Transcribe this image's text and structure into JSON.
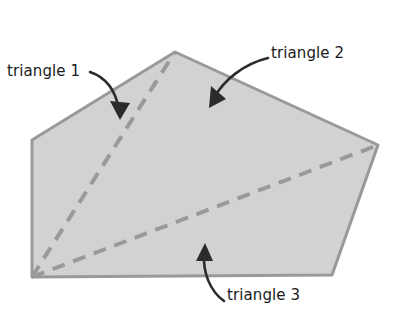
{
  "figure": {
    "name": "polygon-triangulation-diagram",
    "background_color": "#ffffff",
    "width": 414,
    "height": 324,
    "polygon": {
      "name": "pentagon",
      "fill_color": "#d2d2d2",
      "stroke_color": "#999999",
      "stroke_width": 3,
      "vertices": [
        {
          "label": "left",
          "x": 32,
          "y": 140
        },
        {
          "label": "apex",
          "x": 175,
          "y": 52
        },
        {
          "label": "right",
          "x": 378,
          "y": 145
        },
        {
          "label": "bottom-right",
          "x": 332,
          "y": 275
        },
        {
          "label": "bottom-left",
          "x": 32,
          "y": 277
        }
      ]
    },
    "diagonals": [
      {
        "name": "diagonal-bottomleft-to-apex",
        "from": {
          "x": 32,
          "y": 277
        },
        "to": {
          "x": 175,
          "y": 52
        },
        "style": "dashed",
        "color": "#9a9a9a",
        "width": 4
      },
      {
        "name": "diagonal-bottomleft-to-right",
        "from": {
          "x": 32,
          "y": 277
        },
        "to": {
          "x": 378,
          "y": 145
        },
        "style": "dashed",
        "color": "#9a9a9a",
        "width": 4
      }
    ],
    "arrow_color": "#2b2b2b",
    "arrows": [
      {
        "name": "arrow-to-triangle-1",
        "path": "M 90 72 C 108 78, 116 92, 119 111",
        "head_points": "119,118 112,103 127,104"
      },
      {
        "name": "arrow-to-triangle-2",
        "path": "M 268 58 C 243 64, 222 82, 212 100",
        "head_points": "209,107 211,91 223,100"
      },
      {
        "name": "arrow-to-triangle-3",
        "path": "M 224 301 C 210 291, 203 272, 204 252",
        "head_points": "205,245 212,259, 197,259"
      }
    ]
  },
  "labels": {
    "triangle_1": "triangle 1",
    "triangle_2": "triangle 2",
    "triangle_3": "triangle 3"
  }
}
